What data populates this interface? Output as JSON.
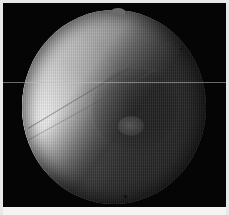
{
  "viewer": {
    "title": "Fluoroscopic radiograph",
    "modality": "X-ray fluoroscopy",
    "width_px": 229,
    "height_px": 215,
    "overlay_text": "",
    "status_text": ""
  },
  "frame": {
    "border_color": "#e8e8e8",
    "background_color": "#050505",
    "bottom_strip_color": "#f4f4f4"
  },
  "aperture": {
    "shape": "circle",
    "center_x": 111,
    "center_y": 104,
    "radius_x": 92,
    "radius_y": 97,
    "rim_color": "#050505",
    "notch_label": "collimator-notch"
  },
  "anatomy": {
    "bone_shaft_label": "bone-shaft",
    "bone_upper_label": "cortical-band",
    "soft_tissue_label": "soft-tissue-field",
    "lesion_label": "central-opacity",
    "nodule_label": "bright-nodule"
  },
  "artifacts": {
    "scanline_label": "vertical-scanline-striping",
    "reference_line_label": "horizontal-reference-line",
    "reference_line_y": 82,
    "reference_line_color": "#bebebe",
    "speck_label": "dark-speck"
  },
  "colors": {
    "bright": "#ffffff",
    "midtone": "#9b9b9b",
    "shadow": "#2c2c2c",
    "black": "#050505"
  }
}
